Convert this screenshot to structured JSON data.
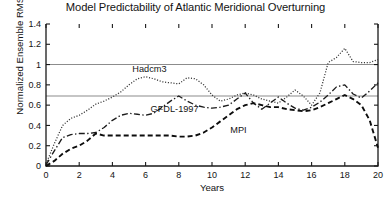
{
  "chart_data": {
    "type": "line",
    "title": "Model Predictability of Atlantic Meridional Overturning",
    "xlabel": "Years",
    "ylabel": "Normalized Ensemble RMSE",
    "xlim": [
      0,
      20
    ],
    "ylim": [
      0,
      1.4
    ],
    "xticks": [
      0,
      2,
      4,
      6,
      8,
      10,
      12,
      14,
      16,
      18,
      20
    ],
    "xtick_labels": [
      "0",
      "2",
      "4",
      "6",
      "8",
      "10",
      "12",
      "14",
      "16",
      "18",
      "20"
    ],
    "yticks": [
      0,
      0.2,
      0.4,
      0.6,
      0.8,
      1,
      1.2,
      1.4
    ],
    "ytick_labels": [
      "0",
      "0.2",
      "0.4",
      "0.6",
      "0.8",
      "1",
      "1.2",
      "1.4"
    ],
    "grid": "horizontal-reference-lines",
    "gridlines": [
      1.0,
      0.69
    ],
    "legend_position": "inline-annotations",
    "x": [
      0,
      0.5,
      1,
      1.5,
      2,
      2.5,
      3,
      3.5,
      4,
      4.5,
      5,
      5.5,
      6,
      6.5,
      7,
      7.5,
      8,
      8.5,
      9,
      9.5,
      10,
      10.5,
      11,
      11.5,
      12,
      12.5,
      13,
      13.5,
      14,
      14.5,
      15,
      15.5,
      16,
      16.5,
      17,
      17.5,
      18,
      18.5,
      19,
      19.5,
      20
    ],
    "series": [
      {
        "name": "Hadcm3",
        "style": "dotted",
        "color": "#333333",
        "label_x": 5.2,
        "label_y": 0.93,
        "values": [
          0.02,
          0.22,
          0.4,
          0.47,
          0.5,
          0.55,
          0.61,
          0.64,
          0.68,
          0.73,
          0.8,
          0.86,
          0.88,
          0.86,
          0.83,
          0.82,
          0.81,
          0.87,
          0.86,
          0.8,
          0.7,
          0.64,
          0.66,
          0.7,
          0.72,
          0.7,
          0.66,
          0.64,
          0.62,
          0.68,
          0.75,
          0.69,
          0.6,
          0.72,
          1.02,
          1.07,
          1.16,
          1.03,
          1.02,
          1.02,
          1.05
        ]
      },
      {
        "name": "GFDL-1997",
        "style": "dashdot",
        "color": "#1c1c1c",
        "label_x": 6.3,
        "label_y": 0.53,
        "values": [
          0.01,
          0.15,
          0.28,
          0.31,
          0.32,
          0.32,
          0.33,
          0.38,
          0.45,
          0.5,
          0.52,
          0.51,
          0.5,
          0.52,
          0.58,
          0.64,
          0.69,
          0.64,
          0.6,
          0.58,
          0.57,
          0.58,
          0.6,
          0.66,
          0.72,
          0.62,
          0.56,
          0.62,
          0.68,
          0.62,
          0.57,
          0.55,
          0.58,
          0.63,
          0.7,
          0.78,
          0.8,
          0.71,
          0.67,
          0.74,
          0.82
        ]
      },
      {
        "name": "MPI",
        "style": "dashed",
        "color": "#0d0d0d",
        "label_x": 11.1,
        "label_y": 0.33,
        "values": [
          0.0,
          0.05,
          0.12,
          0.17,
          0.2,
          0.25,
          0.32,
          0.3,
          0.3,
          0.3,
          0.3,
          0.3,
          0.3,
          0.3,
          0.3,
          0.3,
          0.29,
          0.29,
          0.3,
          0.33,
          0.38,
          0.44,
          0.5,
          0.56,
          0.6,
          0.62,
          0.6,
          0.58,
          0.58,
          0.56,
          0.55,
          0.54,
          0.55,
          0.58,
          0.62,
          0.66,
          0.7,
          0.66,
          0.6,
          0.45,
          0.18
        ]
      }
    ]
  }
}
